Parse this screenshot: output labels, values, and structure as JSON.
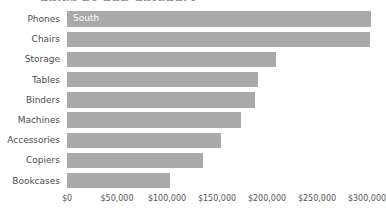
{
  "chart_data": {
    "type": "bar",
    "orientation": "horizontal",
    "title": "Sales by Sub-Category",
    "xlabel": "",
    "ylabel": "",
    "xlim": [
      0,
      310000
    ],
    "grid": false,
    "legend_position": "inline-first-bar",
    "series_name": "South",
    "bar_color": "#a9a9a9",
    "inline_label": "South",
    "categories": [
      "Phones",
      "Chairs",
      "Storage",
      "Tables",
      "Binders",
      "Machines",
      "Accessories",
      "Copiers",
      "Bookcases"
    ],
    "values": [
      304000,
      303000,
      209000,
      191000,
      188000,
      174000,
      154000,
      136000,
      103000
    ],
    "tick_values": [
      0,
      50000,
      100000,
      150000,
      200000,
      250000,
      300000
    ],
    "tick_labels": [
      "$0",
      "$50,000",
      "$100,000",
      "$150,000",
      "$200,000",
      "$250,000",
      "$300,000"
    ]
  }
}
